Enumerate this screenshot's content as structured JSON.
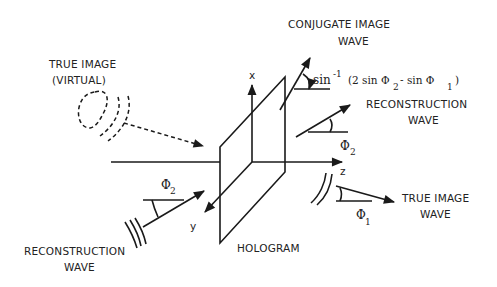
{
  "diagram": {
    "labels": {
      "true_image_line1": "TRUE IMAGE",
      "true_image_line2": "(VIRTUAL)",
      "conjugate_line1": "CONJUGATE IMAGE",
      "conjugate_line2": "WAVE",
      "formula_prefix": "sin",
      "formula_exp": "-1",
      "formula_body1": "(2 sin Φ",
      "formula_sub2": "2",
      "formula_body2": " - sin Φ",
      "formula_sub1": "1",
      "formula_close": ")",
      "recon_right_line1": "RECONSTRUCTION",
      "recon_right_line2": "WAVE",
      "phi2_right": "Φ",
      "phi2_right_sub": "2",
      "axis_x": "x",
      "axis_y": "y",
      "axis_z": "z",
      "true_wave_line1": "TRUE IMAGE",
      "true_wave_line2": "WAVE",
      "phi1": "Φ",
      "phi1_sub": "1",
      "phi2_left": "Φ",
      "phi2_left_sub": "2",
      "recon_left_line1": "RECONSTRUCTION",
      "recon_left_line2": "WAVE",
      "hologram": "HOLOGRAM"
    },
    "colors": {
      "ink": "#1a1a1a",
      "background": "#ffffff"
    }
  }
}
